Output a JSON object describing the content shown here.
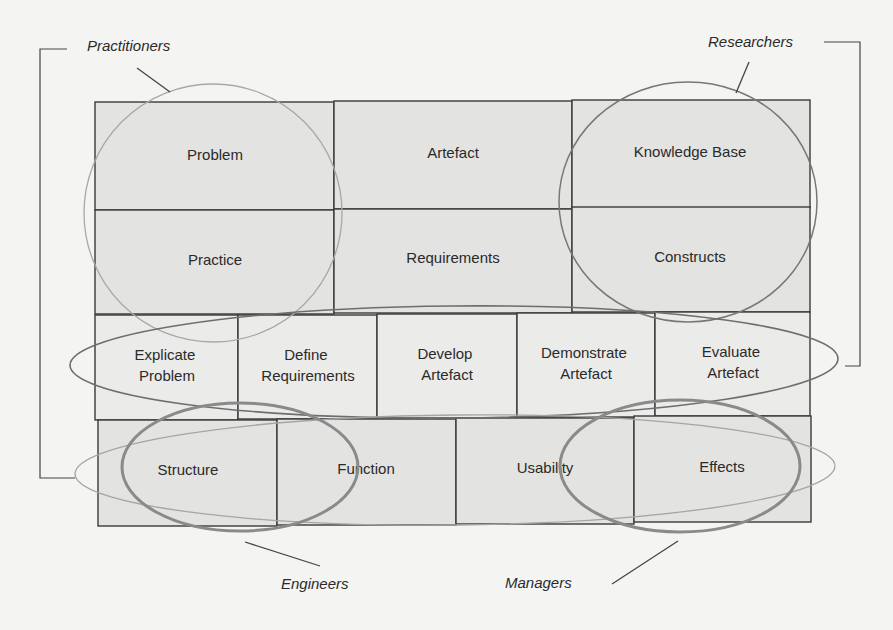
{
  "diagram": {
    "rows": [
      {
        "cells": [
          {
            "label": "Problem"
          },
          {
            "label": "Artefact"
          },
          {
            "label": "Knowledge Base"
          }
        ]
      },
      {
        "cells": [
          {
            "label": "Practice"
          },
          {
            "label": "Requirements"
          },
          {
            "label": "Constructs"
          }
        ]
      },
      {
        "cells": [
          {
            "line1": "Explicate",
            "line2": "Problem"
          },
          {
            "line1": "Define",
            "line2": "Requirements"
          },
          {
            "line1": "Develop",
            "line2": "Artefact"
          },
          {
            "line1": "Demonstrate",
            "line2": "Artefact"
          },
          {
            "line1": "Evaluate",
            "line2": "Artefact"
          }
        ]
      },
      {
        "cells": [
          {
            "label": "Structure"
          },
          {
            "label": "Function"
          },
          {
            "label": "Usability"
          },
          {
            "label": "Effects"
          }
        ]
      }
    ],
    "stakeholders": {
      "practitioners": "Practitioners",
      "researchers": "Researchers",
      "engineers": "Engineers",
      "managers": "Managers"
    },
    "colors": {
      "background": "#f4f4f2",
      "cell_fill": "#e3e3e1",
      "line": "#3a3a3a"
    }
  }
}
